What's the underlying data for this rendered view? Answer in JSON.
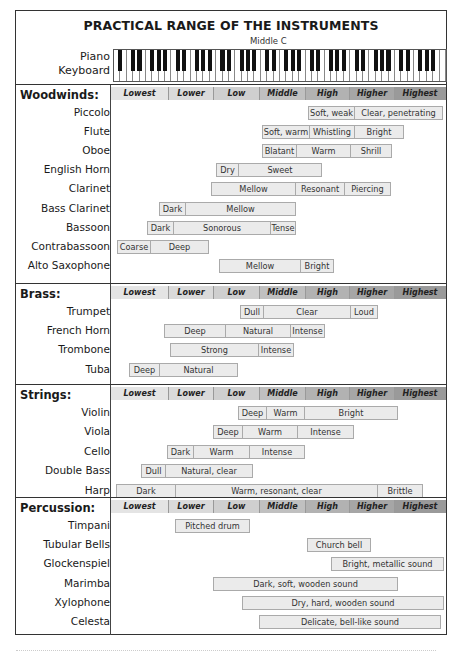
{
  "title": "PRACTICAL RANGE OF THE INSTRUMENTS",
  "keyboard": {
    "label_line1": "Piano",
    "label_line2": "Keyboard",
    "middle_c_label": "Middle C",
    "white_keys": 52
  },
  "range_headers": [
    "Lowest",
    "Lower",
    "Low",
    "Middle",
    "High",
    "Higher",
    "Highest"
  ],
  "colors": {
    "header_gradient": [
      "#e4e4e4",
      "#dadada",
      "#cfcfcf",
      "#c0c0c0",
      "#b2b2b2",
      "#a6a6a6",
      "#9a9a9a"
    ],
    "segment_fill": "#ebebeb",
    "segment_border": "#aaaaaa"
  },
  "sections": [
    {
      "name": "Woodwinds:",
      "instruments": [
        {
          "name": "Piccolo",
          "segments": [
            {
              "label": "Soft, weak",
              "x0": 308,
              "x1": 354
            },
            {
              "label": "Clear, penetrating",
              "x0": 354,
              "x1": 442
            }
          ]
        },
        {
          "name": "Flute",
          "segments": [
            {
              "label": "Soft, warm",
              "x0": 262,
              "x1": 309
            },
            {
              "label": "Whistling",
              "x0": 309,
              "x1": 354
            },
            {
              "label": "Bright",
              "x0": 354,
              "x1": 403
            }
          ]
        },
        {
          "name": "Oboe",
          "segments": [
            {
              "label": "Blatant",
              "x0": 262,
              "x1": 296
            },
            {
              "label": "Warm",
              "x0": 296,
              "x1": 350
            },
            {
              "label": "Shrill",
              "x0": 350,
              "x1": 391
            }
          ]
        },
        {
          "name": "English Horn",
          "segments": [
            {
              "label": "Dry",
              "x0": 216,
              "x1": 238
            },
            {
              "label": "Sweet",
              "x0": 238,
              "x1": 321
            }
          ]
        },
        {
          "name": "Clarinet",
          "segments": [
            {
              "label": "Mellow",
              "x0": 211,
              "x1": 295
            },
            {
              "label": "Resonant",
              "x0": 295,
              "x1": 344
            },
            {
              "label": "Piercing",
              "x0": 344,
              "x1": 390
            }
          ]
        },
        {
          "name": "Bass Clarinet",
          "segments": [
            {
              "label": "Dark",
              "x0": 159,
              "x1": 185
            },
            {
              "label": "Mellow",
              "x0": 185,
              "x1": 295
            }
          ]
        },
        {
          "name": "Bassoon",
          "segments": [
            {
              "label": "Dark",
              "x0": 147,
              "x1": 173
            },
            {
              "label": "Sonorous",
              "x0": 173,
              "x1": 270
            },
            {
              "label": "Tense",
              "x0": 270,
              "x1": 295
            }
          ]
        },
        {
          "name": "Contrabassoon",
          "segments": [
            {
              "label": "Coarse",
              "x0": 117,
              "x1": 150
            },
            {
              "label": "Deep",
              "x0": 150,
              "x1": 208
            }
          ]
        },
        {
          "name": "Alto Saxophone",
          "segments": [
            {
              "label": "Mellow",
              "x0": 219,
              "x1": 300
            },
            {
              "label": "Bright",
              "x0": 300,
              "x1": 333
            }
          ]
        }
      ]
    },
    {
      "name": "Brass:",
      "instruments": [
        {
          "name": "Trumpet",
          "segments": [
            {
              "label": "Dull",
              "x0": 240,
              "x1": 263
            },
            {
              "label": "Clear",
              "x0": 263,
              "x1": 350
            },
            {
              "label": "Loud",
              "x0": 350,
              "x1": 377
            }
          ]
        },
        {
          "name": "French Horn",
          "segments": [
            {
              "label": "Deep",
              "x0": 164,
              "x1": 225
            },
            {
              "label": "Natural",
              "x0": 225,
              "x1": 290
            },
            {
              "label": "Intense",
              "x0": 290,
              "x1": 324
            }
          ]
        },
        {
          "name": "Trombone",
          "segments": [
            {
              "label": "Strong",
              "x0": 170,
              "x1": 258
            },
            {
              "label": "Intense",
              "x0": 258,
              "x1": 293
            }
          ]
        },
        {
          "name": "Tuba",
          "segments": [
            {
              "label": "Deep",
              "x0": 129,
              "x1": 159
            },
            {
              "label": "Natural",
              "x0": 159,
              "x1": 237
            }
          ]
        }
      ]
    },
    {
      "name": "Strings:",
      "instruments": [
        {
          "name": "Violin",
          "segments": [
            {
              "label": "Deep",
              "x0": 238,
              "x1": 266
            },
            {
              "label": "Warm",
              "x0": 266,
              "x1": 304
            },
            {
              "label": "Bright",
              "x0": 304,
              "x1": 397
            }
          ]
        },
        {
          "name": "Viola",
          "segments": [
            {
              "label": "Deep",
              "x0": 213,
              "x1": 242
            },
            {
              "label": "Warm",
              "x0": 242,
              "x1": 297
            },
            {
              "label": "Intense",
              "x0": 297,
              "x1": 353
            }
          ]
        },
        {
          "name": "Cello",
          "segments": [
            {
              "label": "Dark",
              "x0": 167,
              "x1": 193
            },
            {
              "label": "Warm",
              "x0": 193,
              "x1": 249
            },
            {
              "label": "Intense",
              "x0": 249,
              "x1": 304
            }
          ]
        },
        {
          "name": "Double Bass",
          "segments": [
            {
              "label": "Dull",
              "x0": 141,
              "x1": 165
            },
            {
              "label": "Natural, clear",
              "x0": 165,
              "x1": 252
            }
          ]
        },
        {
          "name": "Harp",
          "segments": [
            {
              "label": "Dark",
              "x0": 116,
              "x1": 175
            },
            {
              "label": "Warm, resonant, clear",
              "x0": 175,
              "x1": 377
            },
            {
              "label": "Brittle",
              "x0": 377,
              "x1": 422
            }
          ]
        }
      ]
    },
    {
      "name": "Percussion:",
      "instruments": [
        {
          "name": "Timpani",
          "segments": [
            {
              "label": "Pitched drum",
              "x0": 175,
              "x1": 249
            }
          ]
        },
        {
          "name": "Tubular Bells",
          "segments": [
            {
              "label": "Church bell",
              "x0": 307,
              "x1": 370
            }
          ]
        },
        {
          "name": "Glockenspiel",
          "segments": [
            {
              "label": "Bright, metallic sound",
              "x0": 331,
              "x1": 443
            }
          ]
        },
        {
          "name": "Marimba",
          "segments": [
            {
              "label": "Dark, soft, wooden sound",
              "x0": 213,
              "x1": 397
            }
          ]
        },
        {
          "name": "Xylophone",
          "segments": [
            {
              "label": "Dry, hard, wooden sound",
              "x0": 242,
              "x1": 443
            }
          ]
        },
        {
          "name": "Celesta",
          "segments": [
            {
              "label": "Delicate, bell-like sound",
              "x0": 259,
              "x1": 440
            }
          ]
        }
      ]
    }
  ],
  "chart_data": {
    "type": "table",
    "title": "PRACTICAL RANGE OF THE INSTRUMENTS",
    "subtitle": "Middle C",
    "x_categories": [
      "Lowest",
      "Lower",
      "Low",
      "Middle",
      "High",
      "Higher",
      "Highest"
    ],
    "x_scale_note": "segment ranges given as fractional column positions (0=start of Lowest, 7=end of Highest)",
    "groups": [
      {
        "group": "Woodwinds",
        "rows": [
          {
            "instrument": "Piccolo",
            "segments": [
              [
                "Soft, weak",
                4.4,
                5.4
              ],
              [
                "Clear, penetrating",
                5.4,
                7.0
              ]
            ]
          },
          {
            "instrument": "Flute",
            "segments": [
              [
                "Soft, warm",
                3.0,
                4.1
              ],
              [
                "Whistling",
                4.1,
                5.1
              ],
              [
                "Bright",
                5.1,
                6.2
              ]
            ]
          },
          {
            "instrument": "Oboe",
            "segments": [
              [
                "Blatant",
                3.0,
                3.8
              ],
              [
                "Warm",
                3.8,
                5.0
              ],
              [
                "Shrill",
                5.0,
                5.9
              ]
            ]
          },
          {
            "instrument": "English Horn",
            "segments": [
              [
                "Dry",
                2.0,
                2.5
              ],
              [
                "Sweet",
                2.5,
                4.3
              ]
            ]
          },
          {
            "instrument": "Clarinet",
            "segments": [
              [
                "Mellow",
                1.9,
                3.8
              ],
              [
                "Resonant",
                3.8,
                4.9
              ],
              [
                "Piercing",
                4.9,
                5.9
              ]
            ]
          },
          {
            "instrument": "Bass Clarinet",
            "segments": [
              [
                "Dark",
                0.8,
                1.4
              ],
              [
                "Mellow",
                1.4,
                3.8
              ]
            ]
          },
          {
            "instrument": "Bassoon",
            "segments": [
              [
                "Dark",
                0.6,
                1.2
              ],
              [
                "Sonorous",
                1.2,
                3.5
              ],
              [
                "Tense",
                3.5,
                3.8
              ]
            ]
          },
          {
            "instrument": "Contrabassoon",
            "segments": [
              [
                "Coarse",
                0.1,
                0.7
              ],
              [
                "Deep",
                0.7,
                2.1
              ]
            ]
          },
          {
            "instrument": "Alto Saxophone",
            "segments": [
              [
                "Mellow",
                2.1,
                3.9
              ],
              [
                "Bright",
                3.9,
                4.6
              ]
            ]
          }
        ]
      },
      {
        "group": "Brass",
        "rows": [
          {
            "instrument": "Trumpet",
            "segments": [
              [
                "Dull",
                2.6,
                3.1
              ],
              [
                "Clear",
                3.1,
                5.0
              ],
              [
                "Loud",
                5.0,
                5.6
              ]
            ]
          },
          {
            "instrument": "French Horn",
            "segments": [
              [
                "Deep",
                0.9,
                2.2
              ],
              [
                "Natural",
                2.2,
                3.7
              ],
              [
                "Intense",
                3.7,
                4.4
              ]
            ]
          },
          {
            "instrument": "Trombone",
            "segments": [
              [
                "Strong",
                1.0,
                3.0
              ],
              [
                "Intense",
                3.0,
                3.8
              ]
            ]
          },
          {
            "instrument": "Tuba",
            "segments": [
              [
                "Deep",
                0.3,
                0.8
              ],
              [
                "Natural",
                0.8,
                2.5
              ]
            ]
          }
        ]
      },
      {
        "group": "Strings",
        "rows": [
          {
            "instrument": "Violin",
            "segments": [
              [
                "Deep",
                2.5,
                3.1
              ],
              [
                "Warm",
                3.1,
                4.0
              ],
              [
                "Bright",
                4.0,
                6.0
              ]
            ]
          },
          {
            "instrument": "Viola",
            "segments": [
              [
                "Deep",
                2.0,
                2.6
              ],
              [
                "Warm",
                2.6,
                3.8
              ],
              [
                "Intense",
                3.8,
                5.1
              ]
            ]
          },
          {
            "instrument": "Cello",
            "segments": [
              [
                "Dark",
                1.0,
                1.5
              ],
              [
                "Warm",
                1.5,
                2.8
              ],
              [
                "Intense",
                2.8,
                4.0
              ]
            ]
          },
          {
            "instrument": "Double Bass",
            "segments": [
              [
                "Dull",
                0.5,
                1.0
              ],
              [
                "Natural, clear",
                1.0,
                2.9
              ]
            ]
          },
          {
            "instrument": "Harp",
            "segments": [
              [
                "Dark",
                0.1,
                1.1
              ],
              [
                "Warm, resonant, clear",
                1.1,
                5.6
              ],
              [
                "Brittle",
                5.6,
                6.6
              ]
            ]
          }
        ]
      },
      {
        "group": "Percussion",
        "rows": [
          {
            "instrument": "Timpani",
            "segments": [
              [
                "Pitched drum",
                1.1,
                2.8
              ]
            ]
          },
          {
            "instrument": "Tubular Bells",
            "segments": [
              [
                "Church bell",
                4.0,
                5.4
              ]
            ]
          },
          {
            "instrument": "Glockenspiel",
            "segments": [
              [
                "Bright, metallic sound",
                4.5,
                7.0
              ]
            ]
          },
          {
            "instrument": "Marimba",
            "segments": [
              [
                "Dark, soft, wooden sound",
                2.0,
                6.0
              ]
            ]
          },
          {
            "instrument": "Xylophone",
            "segments": [
              [
                "Dry, hard, wooden sound",
                2.6,
                7.0
              ]
            ]
          },
          {
            "instrument": "Celesta",
            "segments": [
              [
                "Delicate, bell-like sound",
                3.0,
                6.9
              ]
            ]
          }
        ]
      }
    ],
    "grid": false,
    "legend": "none"
  }
}
